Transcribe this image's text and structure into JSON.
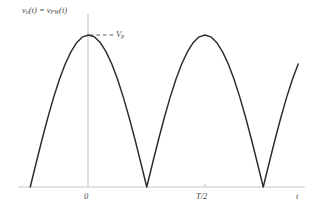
{
  "figure": {
    "background_color": "#ffffff",
    "curve_color": "#2b2b2b",
    "axis_color": "#c8c8c8",
    "text_color": "#4a4a4a"
  },
  "labels": {
    "y_axis": {
      "prefix": "v",
      "sub1": "o",
      "mid": "(t) = v",
      "sub2": "FW",
      "suffix": "(t)"
    },
    "peak": {
      "prefix": "V",
      "sub": "p"
    },
    "x_axis": "t",
    "tick_zero": "0",
    "tick_thalf_numerator": "T",
    "tick_thalf_rest": "/2"
  },
  "chart_data": {
    "type": "line",
    "title": "",
    "subtitle": "",
    "xlabel": "t",
    "ylabel": "v_o(t) = v_FW(t)",
    "legend": [],
    "legend_position": "none",
    "grid": false,
    "xlim": [
      -0.5,
      2.0
    ],
    "ylim": [
      0,
      1.15
    ],
    "xticks": [
      {
        "value": 0,
        "label": "0"
      },
      {
        "value": 1,
        "label": "T/2"
      }
    ],
    "yticks": [
      {
        "value": 1,
        "label": "V_p"
      }
    ],
    "annotations": [
      {
        "type": "dashed-leader",
        "label": "V_p",
        "from_x": 0,
        "from_y": 1,
        "to_x": 0.28,
        "to_y": 1
      }
    ],
    "series": [
      {
        "name": "v_FW(t)",
        "equation": "|V_p * sin(pi * t / (T/2))|",
        "amplitude_Vp": 1,
        "period_T": 2,
        "rectification": "full-wave",
        "zero_crossings_x": [
          -0.5,
          0.5,
          1.5
        ],
        "peaks_x": [
          0,
          1,
          2
        ],
        "x": [
          -0.5,
          -0.45,
          -0.4,
          -0.35,
          -0.3,
          -0.25,
          -0.2,
          -0.15,
          -0.1,
          -0.05,
          0,
          0.05,
          0.1,
          0.15,
          0.2,
          0.25,
          0.3,
          0.35,
          0.4,
          0.45,
          0.5,
          0.55,
          0.6,
          0.65,
          0.7,
          0.75,
          0.8,
          0.85,
          0.9,
          0.95,
          1,
          1.05,
          1.1,
          1.15,
          1.2,
          1.25,
          1.3,
          1.35,
          1.4,
          1.45,
          1.5,
          1.55,
          1.6,
          1.65,
          1.7,
          1.75,
          1.8
        ],
        "y": [
          0,
          0.156,
          0.309,
          0.454,
          0.588,
          0.707,
          0.809,
          0.891,
          0.951,
          0.988,
          1,
          0.988,
          0.951,
          0.891,
          0.809,
          0.707,
          0.588,
          0.454,
          0.309,
          0.156,
          0,
          0.156,
          0.309,
          0.454,
          0.588,
          0.707,
          0.809,
          0.891,
          0.951,
          0.988,
          1,
          0.988,
          0.951,
          0.891,
          0.809,
          0.707,
          0.588,
          0.454,
          0.309,
          0.156,
          0,
          0.156,
          0.309,
          0.454,
          0.588,
          0.707,
          0.809
        ]
      }
    ]
  }
}
